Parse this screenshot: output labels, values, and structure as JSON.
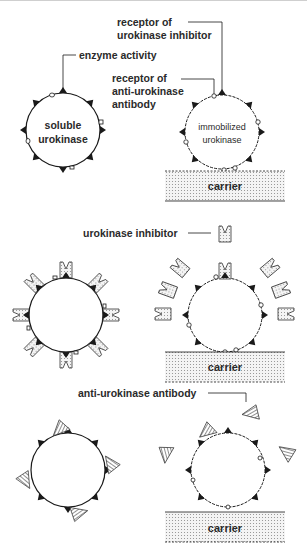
{
  "figure": {
    "panels": [
      {
        "id": "panel-1",
        "labels": {
          "enzyme_activity": "enzyme activity",
          "receptor_inhibitor_line1": "receptor of",
          "receptor_inhibitor_line2": "urokinase inhibitor",
          "receptor_antibody_line1": "receptor of",
          "receptor_antibody_line2": "anti-urokinase",
          "receptor_antibody_line3": "antibody",
          "soluble_line1": "soluble",
          "soluble_line2": "urokinase",
          "immobilized_line1": "immobilized",
          "immobilized_line2": "urokinase",
          "carrier": "carrier"
        }
      },
      {
        "id": "panel-2",
        "labels": {
          "inhibitor": "urokinase inhibitor",
          "carrier": "carrier"
        }
      },
      {
        "id": "panel-3",
        "labels": {
          "antibody": "anti-urokinase antibody",
          "carrier": "carrier"
        }
      }
    ],
    "legend_symbols": {
      "enzyme_active_site": "filled-triangle",
      "inhibitor_receptor": "filled-triangle",
      "antibody_receptor": "open-circle",
      "inhibitor": "dotted-notched-block",
      "antibody": "hatched-triangle"
    },
    "colors": {
      "ink": "#1a1a1a",
      "carrier_fill": "#e8e8e8",
      "background": "#ffffff"
    }
  }
}
